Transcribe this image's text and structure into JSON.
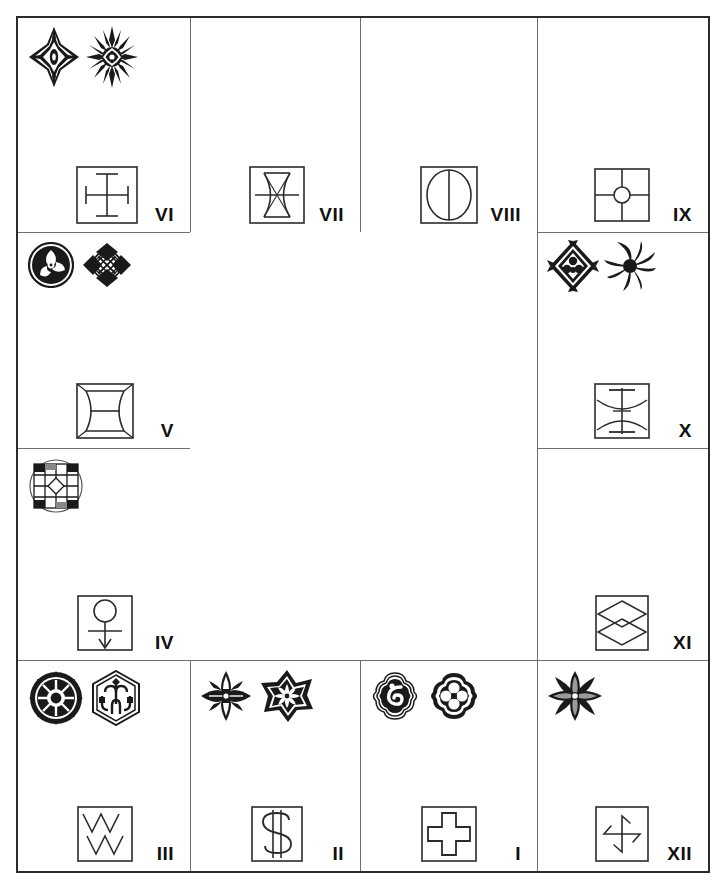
{
  "figure": {
    "type": "ornament-and-symbol-grid",
    "background_color": "#ffffff",
    "ink_color": "#111111",
    "rule_color": "#6f6f6f",
    "frame_color": "#2b2b2b",
    "columns": 4,
    "rows": 4,
    "empty_region_label": ""
  },
  "cells": [
    {
      "id": "cell-vi",
      "numeral": "VI",
      "row": 1,
      "col": 1,
      "motifs": [
        "eight-point-star-diamond-ornament",
        "radiant-starburst-ornament"
      ],
      "motif_count": 2,
      "glyph": "square-with-cross-and-serifs"
    },
    {
      "id": "cell-vii",
      "numeral": "VII",
      "row": 1,
      "col": 2,
      "motifs": [],
      "motif_count": 0,
      "glyph": "square-with-hourglass-lens-and-horizontal-bar"
    },
    {
      "id": "cell-viii",
      "numeral": "VIII",
      "row": 1,
      "col": 3,
      "motifs": [],
      "motif_count": 0,
      "glyph": "square-with-circle-and-vertical-diameter"
    },
    {
      "id": "cell-ix",
      "numeral": "IX",
      "row": 1,
      "col": 4,
      "motifs": [],
      "motif_count": 0,
      "glyph": "square-quartered-with-center-circle"
    },
    {
      "id": "cell-v",
      "numeral": "V",
      "row": 2,
      "col": 1,
      "motifs": [
        "circular-triskelion-swirl-ornament",
        "diamond-lattice-ornament"
      ],
      "motif_count": 2,
      "glyph": "square-with-concave-barrel-and-midline"
    },
    {
      "id": "cell-x",
      "numeral": "X",
      "row": 2,
      "col": 4,
      "motifs": [
        "diamond-floral-ornament",
        "pinwheel-spiral-ornament"
      ],
      "motif_count": 2,
      "glyph": "square-with-arcs-and-vertical-axis"
    },
    {
      "id": "cell-iv",
      "numeral": "IV",
      "row": 3,
      "col": 1,
      "motifs": [
        "checkered-circular-grid-ornament"
      ],
      "motif_count": 1,
      "glyph": "square-with-circle-stem-and-down-arrow"
    },
    {
      "id": "cell-xi",
      "numeral": "XI",
      "row": 3,
      "col": 4,
      "motifs": [],
      "motif_count": 0,
      "glyph": "square-with-two-stacked-diamonds"
    },
    {
      "id": "cell-iii",
      "numeral": "III",
      "row": 4,
      "col": 1,
      "motifs": [
        "spoked-sun-wheel-ornament",
        "hexagonal-knot-ornament"
      ],
      "motif_count": 2,
      "glyph": "square-with-double-zigzag"
    },
    {
      "id": "cell-ii",
      "numeral": "II",
      "row": 4,
      "col": 2,
      "motifs": [
        "fleur-de-lis-ornament",
        "eight-point-star-flower-ornament"
      ],
      "motif_count": 2,
      "glyph": "square-with-dollar-sign"
    },
    {
      "id": "cell-i",
      "numeral": "I",
      "row": 4,
      "col": 3,
      "motifs": [
        "quatrefoil-spiral-ornament",
        "quatrefoil-clover-ornament"
      ],
      "motif_count": 2,
      "glyph": "square-with-greek-cross"
    },
    {
      "id": "cell-xii",
      "numeral": "XII",
      "row": 4,
      "col": 4,
      "motifs": [
        "four-petal-flower-ornament"
      ],
      "motif_count": 1,
      "glyph": "square-with-pinwheel-arrows"
    }
  ],
  "numerals": {
    "vi": "VI",
    "vii": "VII",
    "viii": "VIII",
    "ix": "IX",
    "v": "V",
    "x": "X",
    "iv": "IV",
    "xi": "XI",
    "iii": "III",
    "ii": "II",
    "i": "I",
    "xii": "XII"
  }
}
